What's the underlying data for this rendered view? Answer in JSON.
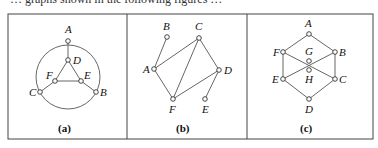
{
  "top_text": "… graphs shown in the following figures …",
  "panels": [
    {
      "caption": "(a)",
      "circle": {
        "cx": 68,
        "cy": 77,
        "r": 32
      },
      "nodes": [
        {
          "id": "A",
          "x": 68,
          "y": 41,
          "lx": 65,
          "ly": 33
        },
        {
          "id": "D",
          "x": 68,
          "y": 60,
          "lx": 73,
          "ly": 64
        },
        {
          "id": "F",
          "x": 55,
          "y": 81,
          "lx": 46,
          "ly": 79
        },
        {
          "id": "E",
          "x": 81,
          "y": 81,
          "lx": 84,
          "ly": 79
        },
        {
          "id": "C",
          "x": 40,
          "y": 92,
          "lx": 29,
          "ly": 96
        },
        {
          "id": "B",
          "x": 96,
          "y": 92,
          "lx": 100,
          "ly": 96
        }
      ],
      "edges": [
        [
          "A",
          "D"
        ],
        [
          "D",
          "F"
        ],
        [
          "D",
          "E"
        ],
        [
          "F",
          "E"
        ],
        [
          "F",
          "C"
        ],
        [
          "E",
          "B"
        ]
      ]
    },
    {
      "caption": "(b)",
      "nodes": [
        {
          "id": "B",
          "x": 167,
          "y": 37,
          "lx": 163,
          "ly": 30
        },
        {
          "id": "C",
          "x": 199,
          "y": 38,
          "lx": 195,
          "ly": 30
        },
        {
          "id": "A",
          "x": 154,
          "y": 69,
          "lx": 143,
          "ly": 73
        },
        {
          "id": "D",
          "x": 219,
          "y": 70,
          "lx": 224,
          "ly": 74
        },
        {
          "id": "F",
          "x": 173,
          "y": 99,
          "lx": 169,
          "ly": 113
        },
        {
          "id": "E",
          "x": 205,
          "y": 99,
          "lx": 202,
          "ly": 113
        }
      ],
      "edges": [
        [
          "A",
          "B"
        ],
        [
          "A",
          "C"
        ],
        [
          "A",
          "F"
        ],
        [
          "C",
          "F"
        ],
        [
          "C",
          "D"
        ],
        [
          "D",
          "F"
        ],
        [
          "D",
          "E"
        ]
      ]
    },
    {
      "caption": "(c)",
      "nodes": [
        {
          "id": "A",
          "x": 309,
          "y": 34,
          "lx": 305,
          "ly": 27
        },
        {
          "id": "F",
          "x": 283,
          "y": 52,
          "lx": 273,
          "ly": 56
        },
        {
          "id": "B",
          "x": 335,
          "y": 52,
          "lx": 339,
          "ly": 56
        },
        {
          "id": "G",
          "x": 309,
          "y": 61,
          "lx": 305,
          "ly": 55
        },
        {
          "id": "H",
          "x": 309,
          "y": 70,
          "lx": 305,
          "ly": 83
        },
        {
          "id": "E",
          "x": 283,
          "y": 79,
          "lx": 272,
          "ly": 83
        },
        {
          "id": "C",
          "x": 335,
          "y": 79,
          "lx": 339,
          "ly": 83
        },
        {
          "id": "D",
          "x": 309,
          "y": 99,
          "lx": 305,
          "ly": 113
        }
      ],
      "edges": [
        [
          "A",
          "F"
        ],
        [
          "A",
          "B"
        ],
        [
          "F",
          "E"
        ],
        [
          "B",
          "C"
        ],
        [
          "E",
          "D"
        ],
        [
          "C",
          "D"
        ],
        [
          "F",
          "C"
        ],
        [
          "E",
          "B"
        ]
      ]
    }
  ]
}
